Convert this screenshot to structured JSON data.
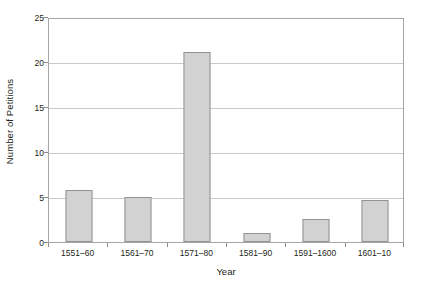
{
  "chart_data": {
    "type": "bar",
    "title": "",
    "xlabel": "Year",
    "ylabel": "Number of Petitions",
    "categories": [
      "1551–60",
      "1561–70",
      "1571–80",
      "1581–90",
      "1591–1600",
      "1601–10"
    ],
    "values": [
      5.8,
      5.0,
      21.1,
      1.0,
      2.6,
      4.7
    ],
    "ylim": [
      0,
      25
    ],
    "yticks": [
      0,
      5,
      10,
      15,
      20,
      25
    ],
    "ytick_labels": [
      "0",
      "5",
      "10",
      "15",
      "20",
      "25"
    ],
    "grid": true,
    "grid_axis": "y",
    "legend": "none",
    "colors": {
      "bar_fill": "#d2d2d2",
      "bar_border": "#939393",
      "gridline": "#c9c9c9",
      "frame": "#a6a6a6",
      "text": "#231f20",
      "background": "#ffffff"
    }
  }
}
